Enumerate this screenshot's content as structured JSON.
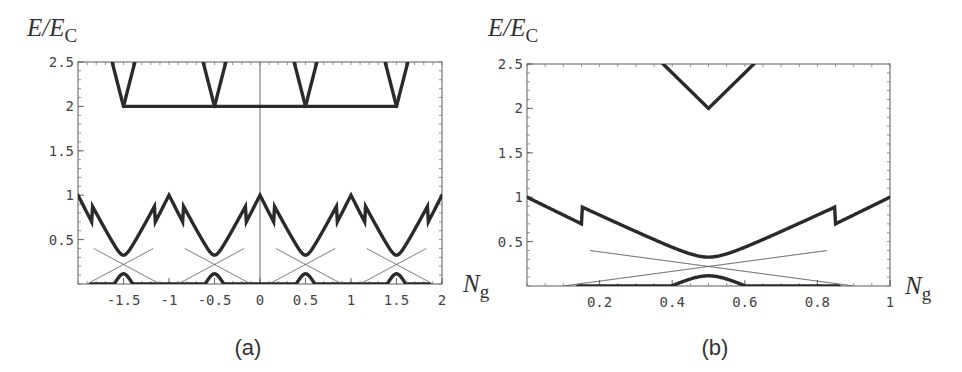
{
  "figure": {
    "panels": [
      {
        "id": "a",
        "label": "(a)",
        "ylabel_main": "E/E",
        "ylabel_sub": "C",
        "xlabel_main": "N",
        "xlabel_sub": "g"
      },
      {
        "id": "b",
        "label": "(b)",
        "ylabel_main": "E/E",
        "ylabel_sub": "C",
        "xlabel_main": "N",
        "xlabel_sub": "g"
      }
    ]
  },
  "chart_data": [
    {
      "type": "line",
      "title": "(a)",
      "xlabel": "N_g",
      "ylabel": "E/E_C",
      "xlim": [
        -2,
        2
      ],
      "ylim": [
        0,
        2.5
      ],
      "xticks": [
        -1.5,
        -1,
        -0.5,
        0,
        0.5,
        1,
        1.5,
        2
      ],
      "xtick_labels": [
        "-1.5",
        "-1",
        "-0.5",
        "0",
        "0.5",
        "1",
        "1.5",
        "2"
      ],
      "yticks": [
        0.5,
        1,
        1.5,
        2,
        2.5
      ],
      "ytick_labels": [
        "0.5",
        "1",
        "1.5",
        "2",
        "2.5"
      ],
      "grid": false,
      "vertical_line_at_x": 0,
      "description": "Periodic charging energy parabolas E = (N_g - n)^2 relative to ground state; thick lines are level curves, thin lines show unperturbed crossings near half-integer N_g with avoided crossings (gap) near E approx 0.12-0.33.",
      "series": [
        {
          "name": "parabola crossings at E=1",
          "x": [
            -2,
            -1,
            0,
            1,
            2
          ],
          "values": [
            1,
            1,
            1,
            1,
            1
          ]
        },
        {
          "name": "crossings at E~2.25",
          "x": [
            -1.5,
            -0.5,
            0.5,
            1.5
          ],
          "values": [
            2.25,
            2.25,
            2.25,
            2.25
          ]
        },
        {
          "name": "upper avoided-crossing minimum",
          "x": [
            -1.5,
            -0.5,
            0.5,
            1.5
          ],
          "values": [
            0.33,
            0.33,
            0.33,
            0.33
          ]
        },
        {
          "name": "lower avoided-crossing maximum",
          "x": [
            -1.5,
            -0.5,
            0.5,
            1.5
          ],
          "values": [
            0.12,
            0.12,
            0.12,
            0.12
          ]
        },
        {
          "name": "thin crossing point",
          "x": [
            -1.5,
            -0.5,
            0.5,
            1.5
          ],
          "values": [
            0.22,
            0.22,
            0.22,
            0.22
          ]
        }
      ]
    },
    {
      "type": "line",
      "title": "(b)",
      "xlabel": "N_g",
      "ylabel": "E/E_C",
      "xlim": [
        0,
        1
      ],
      "ylim": [
        0,
        2.5
      ],
      "xticks": [
        0.2,
        0.4,
        0.6,
        0.8,
        1
      ],
      "xtick_labels": [
        "0.2",
        "0.4",
        "0.6",
        "0.8",
        "1"
      ],
      "yticks": [
        0.5,
        1,
        1.5,
        2,
        2.5
      ],
      "ytick_labels": [
        "0.5",
        "1",
        "1.5",
        "2",
        "2.5"
      ],
      "grid": false,
      "series": [
        {
          "name": "rising upper band",
          "x": [
            0,
            0.2,
            0.4,
            0.5,
            0.58
          ],
          "values": [
            1,
            1.45,
            2.0,
            2.25,
            2.5
          ]
        },
        {
          "name": "falling upper band",
          "x": [
            0.42,
            0.5,
            0.6,
            0.8,
            1
          ],
          "values": [
            2.5,
            2.25,
            2.0,
            1.45,
            1
          ]
        },
        {
          "name": "upper level (thick)",
          "x": [
            0,
            0.2,
            0.4,
            0.5,
            0.6,
            0.8,
            1
          ],
          "values": [
            1,
            0.68,
            0.38,
            0.33,
            0.38,
            0.68,
            1
          ]
        },
        {
          "name": "lower level (thick)",
          "x": [
            0.14,
            0.3,
            0.45,
            0.5,
            0.55,
            0.7,
            0.86
          ],
          "values": [
            0,
            0.06,
            0.12,
            0.12,
            0.12,
            0.06,
            0
          ]
        },
        {
          "name": "thin crossing lines",
          "x": [
            0.1,
            0.5,
            0.9
          ],
          "values": [
            0,
            0.22,
            0
          ]
        }
      ]
    }
  ]
}
